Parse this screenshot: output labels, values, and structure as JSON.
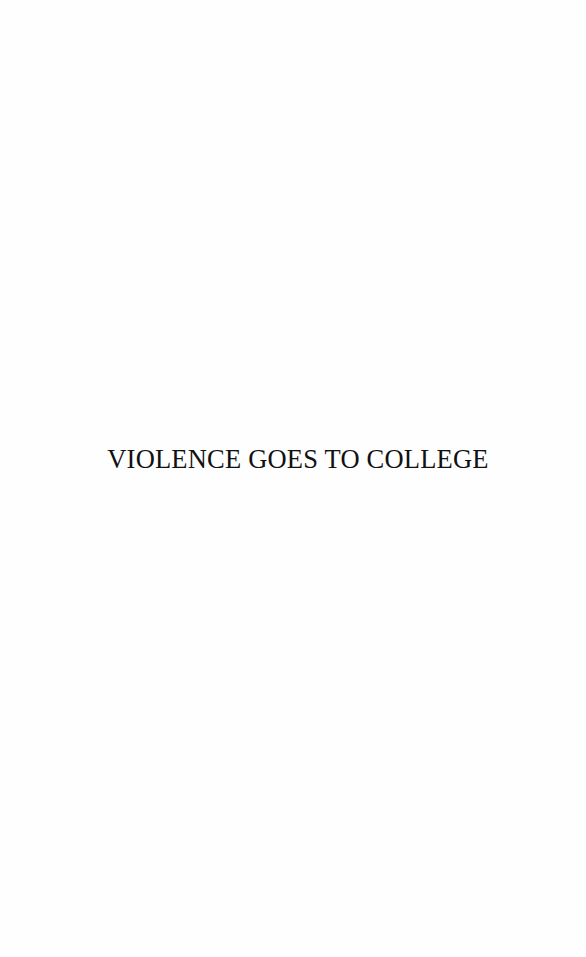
{
  "page": {
    "type": "half-title page",
    "title": "VIOLENCE GOES TO COLLEGE"
  },
  "colors": {
    "background": "#fefefe",
    "text": "#111111"
  }
}
